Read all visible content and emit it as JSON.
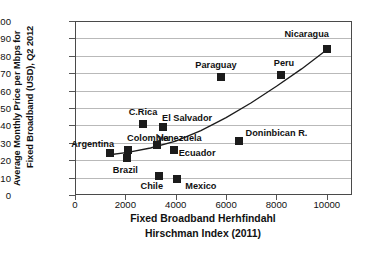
{
  "chart_data": {
    "type": "scatter",
    "title": "",
    "xlabel": "Fixed Broadband Herhfindahl Hirschman Index (2011)",
    "xlabel_line1": "Fixed Broadband Herhfindahl",
    "xlabel_line2": "Hirschman Index (2011)",
    "ylabel": "Average Monthly Price per Mbps for Fixed Broadband (USD), Q2 2012",
    "ylabel_line1": "Average Monthly Price per Mbps for",
    "ylabel_line2": "Fixed Broadband  (USD), Q2 2012",
    "xlim": [
      0,
      11000
    ],
    "ylim": [
      0,
      100
    ],
    "xticks": [
      0,
      2000,
      4000,
      6000,
      8000,
      10000
    ],
    "yticks": [
      0,
      10,
      20,
      30,
      40,
      50,
      60,
      70,
      80,
      90,
      100
    ],
    "grid": "horizontal",
    "legend": "none",
    "marker_color": "#1b1b1b",
    "grid_color": "#b9b9b9",
    "axis_color": "#4a4a4a",
    "points": [
      {
        "label": "Argentina",
        "x": 1400,
        "y": 24,
        "lx": 700,
        "ly": 29.5
      },
      {
        "label": "Brazil",
        "x": 2050,
        "y": 21,
        "lx": 2000,
        "ly": 14.5
      },
      {
        "label": "Colombia",
        "x": 2100,
        "y": 26,
        "lx": 2900,
        "ly": 32.5
      },
      {
        "label": "C.Rica",
        "x": 2700,
        "y": 41,
        "lx": 2700,
        "ly": 47.5
      },
      {
        "label": "Venezuela",
        "x": 3250,
        "y": 29,
        "lx": 4150,
        "ly": 32.5
      },
      {
        "label": "Chile",
        "x": 3350,
        "y": 11,
        "lx": 3050,
        "ly": 5.0
      },
      {
        "label": "El Salvador",
        "x": 3500,
        "y": 39,
        "lx": 4450,
        "ly": 44.5
      },
      {
        "label": "Ecuador",
        "x": 3950,
        "y": 26,
        "lx": 4850,
        "ly": 24.0
      },
      {
        "label": "Mexico",
        "x": 4050,
        "y": 9,
        "lx": 5000,
        "ly": 5.0
      },
      {
        "label": "Paraguay",
        "x": 5800,
        "y": 68,
        "lx": 5600,
        "ly": 74.5
      },
      {
        "label": "Doninbican R.",
        "x": 6500,
        "y": 31,
        "lx": 8000,
        "ly": 35.5
      },
      {
        "label": "Peru",
        "x": 8200,
        "y": 69,
        "lx": 8300,
        "ly": 76.0
      },
      {
        "label": "Nicaragua",
        "x": 10000,
        "y": 84,
        "lx": 9200,
        "ly": 92.5
      }
    ],
    "trendline": {
      "name": "trend",
      "points": [
        {
          "x": 1300,
          "y": 23.0
        },
        {
          "x": 2100,
          "y": 24.5
        },
        {
          "x": 3000,
          "y": 27.0
        },
        {
          "x": 4000,
          "y": 31.0
        },
        {
          "x": 5000,
          "y": 37.0
        },
        {
          "x": 6000,
          "y": 44.5
        },
        {
          "x": 7000,
          "y": 53.0
        },
        {
          "x": 8000,
          "y": 62.5
        },
        {
          "x": 9000,
          "y": 72.5
        },
        {
          "x": 10050,
          "y": 84.0
        }
      ]
    }
  }
}
